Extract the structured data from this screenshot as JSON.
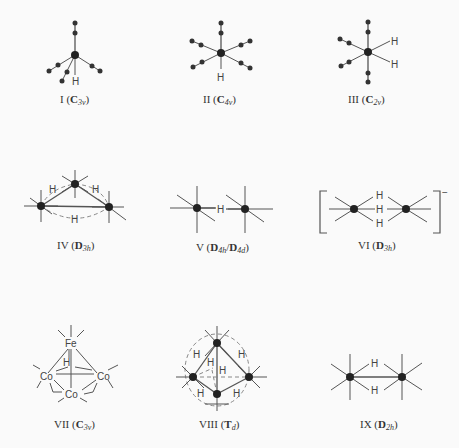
{
  "figure": {
    "structures": [
      {
        "id": "I",
        "numeral": "I",
        "group": "C",
        "group_sub": "3v",
        "atoms": [
          "H"
        ]
      },
      {
        "id": "II",
        "numeral": "II",
        "group": "C",
        "group_sub": "4v",
        "atoms": [
          "H"
        ]
      },
      {
        "id": "III",
        "numeral": "III",
        "group": "C",
        "group_sub": "2v",
        "atoms": [
          "H",
          "H"
        ]
      },
      {
        "id": "IV",
        "numeral": "IV",
        "group": "D",
        "group_sub": "3h",
        "atoms": [
          "H",
          "H",
          "H"
        ]
      },
      {
        "id": "V",
        "numeral": "V",
        "group": "D",
        "group_sub": "4h",
        "group2": "D",
        "group2_sub": "4d",
        "atoms": [
          "H"
        ]
      },
      {
        "id": "VI",
        "numeral": "VI",
        "group": "D",
        "group_sub": "3h",
        "charge": "−",
        "atoms": [
          "H",
          "H",
          "H"
        ]
      },
      {
        "id": "VII",
        "numeral": "VII",
        "group": "C",
        "group_sub": "3v",
        "atoms": [
          "Fe",
          "H",
          "Co",
          "Co",
          "Co"
        ]
      },
      {
        "id": "VIII",
        "numeral": "VIII",
        "group": "T",
        "group_sub": "d",
        "atoms": [
          "H",
          "H",
          "H",
          "H",
          "H",
          "H"
        ]
      },
      {
        "id": "IX",
        "numeral": "IX",
        "group": "D",
        "group_sub": "2h",
        "atoms": [
          "H",
          "H"
        ]
      }
    ]
  }
}
